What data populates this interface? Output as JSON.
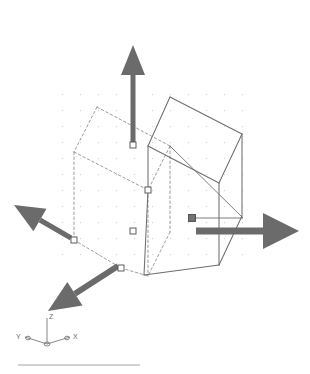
{
  "app": {
    "name": "cad-viewport",
    "title": "3D Solid Box with Grips — Isometric View",
    "background_color": "#ffffff"
  },
  "viewport": {
    "width": 310,
    "height": 374,
    "grid": {
      "visible": true,
      "dot_color": "#d9b9bd",
      "spacing_x": 18,
      "spacing_y": 16,
      "origin_x": 62,
      "origin_y": 94,
      "cols": 11,
      "rows": 11
    }
  },
  "colors": {
    "solid_edge": "#6e6e6e",
    "dashed_edge": "#8a8a8a",
    "arrow_fill": "#6b6b6b",
    "grip_stroke": "#4d4d4d",
    "grip_fill_cold": "#ffffff",
    "grip_fill_hot": "#707070",
    "ucs_color": "#7a7a7a",
    "separator": "#9a9a9a"
  },
  "solid_box": {
    "name": "solid-box-front",
    "style": "solid",
    "vertices": {
      "top_back": [
        170,
        97
      ],
      "top_right": [
        242,
        134
      ],
      "top_left": [
        148,
        146
      ],
      "top_front": [
        219,
        183
      ],
      "bottom_right": [
        242,
        216
      ],
      "bottom_left": [
        148,
        190
      ],
      "bottom_front": [
        219,
        265
      ],
      "bottom_near": [
        144,
        275
      ]
    }
  },
  "dashed_box": {
    "name": "dashed-box-back",
    "style": "dashed",
    "vertices": {
      "top_back": [
        97,
        107
      ],
      "top_right": [
        170,
        146
      ],
      "top_left": [
        74,
        152
      ],
      "top_front": [
        148,
        190
      ],
      "bottom_left": [
        74,
        240
      ],
      "bottom_front": [
        148,
        276
      ],
      "bottom_near": [
        121,
        268
      ],
      "bottom_right": [
        170,
        232
      ]
    }
  },
  "grips": [
    {
      "name": "grip-top-face",
      "x": 133,
      "y": 145,
      "state": "cold",
      "shape": "square",
      "size": 6
    },
    {
      "name": "grip-center-vertex",
      "x": 148,
      "y": 190,
      "state": "cold",
      "shape": "square",
      "size": 6
    },
    {
      "name": "grip-front-face",
      "x": 133,
      "y": 231,
      "state": "cold",
      "shape": "square",
      "size": 6
    },
    {
      "name": "grip-left-corner",
      "x": 74,
      "y": 240,
      "state": "cold",
      "shape": "square",
      "size": 6
    },
    {
      "name": "grip-bottom-corner",
      "x": 121,
      "y": 268,
      "state": "cold",
      "shape": "square",
      "size": 6
    },
    {
      "name": "grip-right-face-hot",
      "x": 192,
      "y": 218,
      "state": "hot",
      "shape": "square",
      "size": 7
    }
  ],
  "arrows": [
    {
      "name": "grip-arrow-up-z",
      "direction": "up",
      "axis": "Z",
      "tail": [
        133,
        142
      ],
      "tip": [
        133,
        45
      ],
      "shaft_width": 5,
      "head_length": 30,
      "head_width": 24
    },
    {
      "name": "grip-arrow-right-x",
      "direction": "right",
      "axis": "X",
      "tail": [
        196,
        231
      ],
      "tip": [
        299,
        231
      ],
      "shaft_width": 7,
      "head_length": 36,
      "head_width": 36
    },
    {
      "name": "grip-arrow-upleft-y",
      "direction": "up-left",
      "axis": "Y",
      "tail": [
        71,
        238
      ],
      "tip": [
        14,
        205
      ],
      "shaft_width": 5,
      "head_length": 30,
      "head_width": 26
    },
    {
      "name": "grip-arrow-downleft-x",
      "direction": "down-left",
      "axis": "X",
      "tail": [
        118,
        266
      ],
      "tip": [
        48,
        311
      ],
      "shaft_width": 6,
      "head_length": 32,
      "head_width": 28
    }
  ],
  "leader_lines": [
    {
      "name": "leader-right-grip-to-corner",
      "from": [
        196,
        218
      ],
      "to": [
        243,
        218
      ]
    },
    {
      "name": "leader-corner-diagonal",
      "from": [
        170,
        146
      ],
      "to": [
        243,
        218
      ]
    }
  ],
  "ucs_icon": {
    "name": "ucs-icon",
    "origin": [
      47,
      344
    ],
    "z_tip": [
      47,
      318
    ],
    "x_tip": [
      70,
      337
    ],
    "y_tip": [
      25,
      337
    ],
    "labels": {
      "x": "X",
      "y": "Y",
      "z": "Z"
    }
  },
  "separator": {
    "name": "bottom-separator",
    "x1": 18,
    "y1": 365,
    "x2": 140,
    "y2": 365
  }
}
